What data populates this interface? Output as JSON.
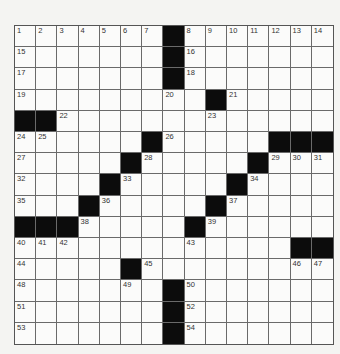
{
  "puzzle": {
    "type": "crossword",
    "size": [
      15,
      15
    ],
    "grid": [
      [
        1,
        2,
        3,
        4,
        5,
        6,
        7,
        "#",
        8,
        9,
        10,
        11,
        12,
        13,
        14
      ],
      [
        15,
        0,
        0,
        0,
        0,
        0,
        0,
        "#",
        16,
        0,
        0,
        0,
        0,
        0,
        0
      ],
      [
        17,
        0,
        0,
        0,
        0,
        0,
        0,
        "#",
        18,
        0,
        0,
        0,
        0,
        0,
        0
      ],
      [
        19,
        0,
        0,
        0,
        0,
        0,
        0,
        20,
        0,
        "#",
        21,
        0,
        0,
        0,
        0
      ],
      [
        "#",
        "#",
        22,
        0,
        0,
        0,
        0,
        0,
        0,
        23,
        0,
        0,
        0,
        0,
        0
      ],
      [
        24,
        25,
        0,
        0,
        0,
        0,
        "#",
        26,
        0,
        0,
        0,
        0,
        "#",
        "#",
        "#"
      ],
      [
        27,
        0,
        0,
        0,
        0,
        "#",
        28,
        0,
        0,
        0,
        0,
        "#",
        29,
        30,
        31
      ],
      [
        32,
        0,
        0,
        0,
        "#",
        33,
        0,
        0,
        0,
        0,
        "#",
        34,
        0,
        0,
        0
      ],
      [
        35,
        0,
        0,
        "#",
        36,
        0,
        0,
        0,
        0,
        "#",
        37,
        0,
        0,
        0,
        0
      ],
      [
        "#",
        "#",
        "#",
        38,
        0,
        0,
        0,
        0,
        "#",
        39,
        0,
        0,
        0,
        0,
        0
      ],
      [
        40,
        41,
        42,
        0,
        0,
        0,
        0,
        0,
        43,
        0,
        0,
        0,
        0,
        "#",
        "#"
      ],
      [
        44,
        0,
        0,
        0,
        0,
        "#",
        45,
        0,
        0,
        0,
        0,
        0,
        0,
        46,
        47
      ],
      [
        48,
        0,
        0,
        0,
        0,
        49,
        0,
        "#",
        50,
        0,
        0,
        0,
        0,
        0,
        0
      ],
      [
        51,
        0,
        0,
        0,
        0,
        0,
        0,
        "#",
        52,
        0,
        0,
        0,
        0,
        0,
        0
      ],
      [
        53,
        0,
        0,
        0,
        0,
        0,
        0,
        "#",
        54,
        0,
        0,
        0,
        0,
        0,
        0
      ]
    ]
  }
}
